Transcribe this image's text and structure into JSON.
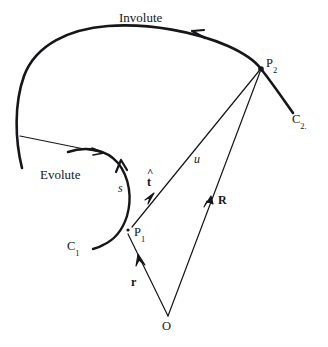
{
  "figure": {
    "background_color": "#ffffff",
    "ink_color": "#16161a",
    "labels": {
      "involute": "Involute",
      "evolute": "Evolute",
      "point_p1": "P",
      "point_p1_sub": "1",
      "point_p2": "P",
      "point_p2_sub": "2",
      "curve_c1": "C",
      "curve_c1_sub": "1",
      "curve_c2": "C",
      "curve_c2_sub": "2.",
      "origin": "O",
      "arc_length": "s",
      "tangent_unit": "t",
      "tangent_hat": "^",
      "vector_u": "u",
      "vector_r_lower": "r",
      "vector_R_upper": "R"
    }
  },
  "geometry": {
    "points": {
      "O": [
        168,
        318
      ],
      "P1": [
        127,
        231
      ],
      "P2": [
        261,
        69
      ],
      "involute_start": [
        22,
        168
      ],
      "involute_end": [
        293,
        113
      ],
      "evolute_start": [
        68,
        152
      ],
      "evolute_end": [
        103,
        245
      ],
      "tangent_branch": [
        20,
        136
      ]
    },
    "vectors": [
      {
        "name": "r",
        "from": "O",
        "to": "P1"
      },
      {
        "name": "R",
        "from": "O",
        "to": "P2"
      },
      {
        "name": "u",
        "from": "P1",
        "to": "P2"
      }
    ],
    "arrow_marks": [
      {
        "name": "involute-direction-arrow",
        "at": [
          199,
          33
        ],
        "points": "left"
      },
      {
        "name": "evolute-direction-arrow",
        "at": [
          124,
          167
        ],
        "points": "up"
      },
      {
        "name": "tangent-line-arrow",
        "at": [
          101,
          152
        ],
        "points": "right"
      },
      {
        "name": "u-vector-arrow",
        "at": [
          152,
          196
        ],
        "points": "up-right"
      },
      {
        "name": "R-vector-arrow",
        "at": [
          208,
          203
        ],
        "points": "up-right"
      },
      {
        "name": "r-vector-arrow",
        "at": [
          141,
          271
        ],
        "points": "up-left"
      }
    ]
  }
}
